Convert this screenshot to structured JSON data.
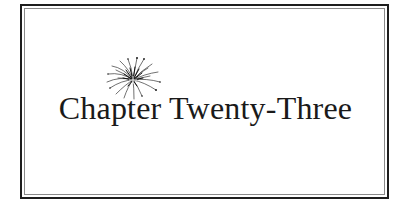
{
  "page": {
    "chapter_title": "Chapter Twenty-Three",
    "ornament": "firework-burst-icon"
  },
  "colors": {
    "text": "#1a1a1a",
    "frame_outer": "#1e1e1e",
    "frame_inner": "#8a8a8a",
    "background": "#ffffff"
  }
}
